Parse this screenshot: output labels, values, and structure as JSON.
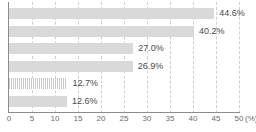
{
  "chart_data": {
    "type": "bar",
    "orientation": "horizontal",
    "title": "",
    "xlabel": "(%)",
    "ylabel": "",
    "xlim": [
      0,
      50
    ],
    "xticks": [
      0,
      5,
      10,
      15,
      20,
      25,
      30,
      35,
      40,
      45,
      50
    ],
    "xtick_labels": [
      "0",
      "5",
      "10",
      "15",
      "20",
      "25",
      "30",
      "35",
      "40",
      "45",
      "50"
    ],
    "grid": true,
    "grid_style": "dashed-vertical",
    "legend": "none",
    "categories": [
      "",
      "",
      "",
      "",
      "",
      ""
    ],
    "values": [
      44.6,
      40.2,
      27.0,
      26.9,
      12.7,
      12.6
    ],
    "data_labels": [
      "44.6%",
      "40.2%",
      "27.0%",
      "26.9%",
      "12.7%",
      "12.6%"
    ],
    "bar_styles": [
      "solid",
      "solid",
      "solid",
      "solid",
      "striped",
      "solid"
    ],
    "colors": {
      "bar_fill": "#d9d9d9",
      "bar_stripe": "#c9c9c9",
      "gridline": "#cfcfcf",
      "axis": "#8c8c8c",
      "label_text": "#4a4a4a",
      "tick_text": "#6b6b6b",
      "background": "#ffffff"
    }
  },
  "axis": {
    "unit_label": "(%)"
  }
}
